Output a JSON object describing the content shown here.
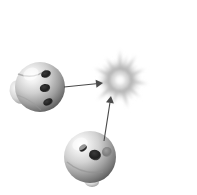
{
  "scene": {
    "title": "Two spheres emitting arrows toward a radiating burst",
    "background_color": "#ffffff",
    "width": 197,
    "height": 195,
    "palette": {
      "sphere_light": "#f2f2f2",
      "sphere_mid": "#b8b8b8",
      "sphere_dark": "#6e6e6e",
      "sphere_shadow": "#3d3d3d",
      "spot_dark": "#2b2b2b",
      "spot_grey": "#8a8a8a",
      "burst_core": "#fafafa",
      "burst_mid": "#b0b0b0",
      "burst_edge": "#dedede",
      "arrow_color": "#4a4a4a"
    }
  },
  "objects": {
    "sphere_left": {
      "label": "Sphere A",
      "center_x": 40,
      "center_y": 87,
      "radius": 25,
      "highlight_x": 31,
      "highlight_y": 74,
      "spots": [
        {
          "label": "spot-1",
          "cx": 46,
          "cy": 74,
          "rx": 5.0,
          "ry": 3.6,
          "rotation": -20,
          "color": "#2b2b2b"
        },
        {
          "label": "spot-2",
          "cx": 45,
          "cy": 88,
          "rx": 5.2,
          "ry": 4.0,
          "rotation": -10,
          "color": "#272727"
        },
        {
          "label": "spot-3",
          "cx": 48,
          "cy": 102,
          "rx": 5.0,
          "ry": 3.4,
          "rotation": -25,
          "color": "#2f2f2f"
        }
      ],
      "lobe": {
        "cx": 19,
        "cy": 92,
        "rx": 9,
        "ry": 12,
        "rotation": -20
      }
    },
    "sphere_bottom": {
      "label": "Sphere B",
      "center_x": 90,
      "center_y": 157,
      "radius": 26,
      "highlight_x": 80,
      "highlight_y": 144,
      "spots": [
        {
          "label": "spot-1",
          "cx": 83,
          "cy": 148,
          "rx": 4.2,
          "ry": 3.0,
          "rotation": -35,
          "color": "#262626"
        },
        {
          "label": "spot-2",
          "cx": 95,
          "cy": 155,
          "rx": 6.0,
          "ry": 5.2,
          "rotation": 15,
          "color": "#2a2a2a"
        },
        {
          "label": "spot-3",
          "cx": 107,
          "cy": 152,
          "rx": 5.0,
          "ry": 5.0,
          "rotation": 0,
          "color": "#8a8a8a"
        }
      ],
      "foot": {
        "cx": 92,
        "cy": 182,
        "rx": 7,
        "ry": 5,
        "rotation": 0
      }
    },
    "burst": {
      "label": "Radiating burst",
      "center_x": 120,
      "center_y": 80,
      "core_radius": 9,
      "inner_radius": 14,
      "outer_radius": 36,
      "spike_count": 22
    }
  },
  "arrows": [
    {
      "label": "arrow-from-sphere-a",
      "x1": 64,
      "y1": 87,
      "x2": 103,
      "y2": 83,
      "head_length": 7,
      "head_width": 4,
      "color": "#4a4a4a",
      "stroke_width": 1.1
    },
    {
      "label": "arrow-from-sphere-b",
      "x1": 104,
      "y1": 141,
      "x2": 111,
      "y2": 96,
      "head_length": 7,
      "head_width": 4,
      "color": "#4a4a4a",
      "stroke_width": 1.1
    }
  ]
}
